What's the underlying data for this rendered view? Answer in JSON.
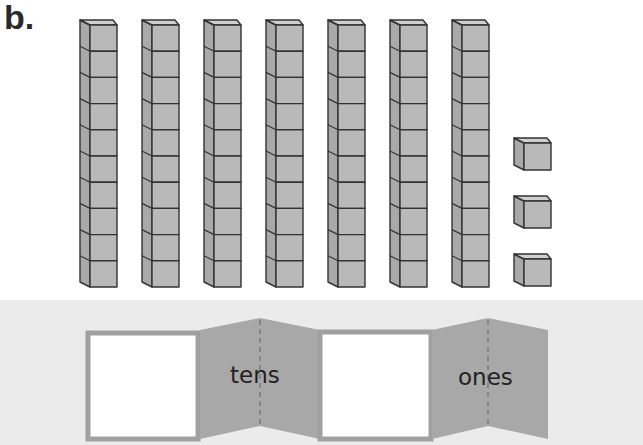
{
  "title": "b.",
  "blocks": {
    "tens_rods": 7,
    "ones_cubes": 3,
    "cubes_per_rod": 10,
    "fill_color": "#b9b9b9",
    "edge_color": "#333333"
  },
  "place_value_chart": {
    "columns": [
      {
        "label": "tens",
        "answer_box_value": ""
      },
      {
        "label": "ones",
        "answer_box_value": ""
      }
    ],
    "fold_color": "#a8a8a8",
    "box_border_color": "#a0a0a0"
  }
}
